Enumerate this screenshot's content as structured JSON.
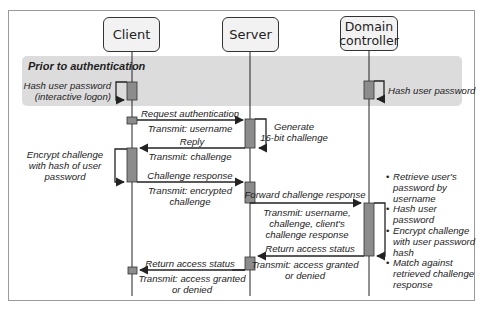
{
  "diagram": {
    "type": "sequence",
    "colors": {
      "band": "#dcdcdc",
      "activation": "#8c8c8c",
      "line": "#222222",
      "actor_fill": "#f2f2f2"
    }
  },
  "actors": [
    {
      "id": "client",
      "label": "Client"
    },
    {
      "id": "server",
      "label": "Server"
    },
    {
      "id": "dc",
      "label": "Domain controller",
      "line1": "Domain",
      "line2": "controller"
    }
  ],
  "band": {
    "title": "Prior to authentication",
    "client_note_line1": "Hash user password",
    "client_note_line2": "(interactive logon)",
    "dc_note": "Hash user password"
  },
  "messages": [
    {
      "from": "client",
      "to": "server",
      "label": "Request authentication",
      "sublabel": "Transmit: username"
    },
    {
      "from": "server",
      "to": "server",
      "label_line1": "Generate",
      "label_line2": "16-bit challenge"
    },
    {
      "from": "server",
      "to": "client",
      "label": "Reply",
      "sublabel": "Transmit: challenge"
    },
    {
      "from": "client",
      "to": "client",
      "label_line1": "Encrypt challenge",
      "label_line2": "with hash of user",
      "label_line3": "password"
    },
    {
      "from": "client",
      "to": "server",
      "label": "Challenge response",
      "sublabel_line1": "Transmit: encrypted",
      "sublabel_line2": "challenge"
    },
    {
      "from": "server",
      "to": "dc",
      "label": "Forward challenge response",
      "sublabel_line1": "Transmit: username,",
      "sublabel_line2": "challenge, client's",
      "sublabel_line3": "challenge response"
    },
    {
      "from": "dc",
      "to": "server",
      "label": "Return access status",
      "sublabel_line1": "Transmit: access granted",
      "sublabel_line2": "or denied"
    },
    {
      "from": "server",
      "to": "client",
      "label": "Return access status",
      "sublabel_line1": "Transmit: access granted",
      "sublabel_line2": "or denied"
    }
  ],
  "dc_notes": [
    {
      "line1": "Retrieve user's",
      "line2": "password by",
      "line3": "username"
    },
    {
      "line1": "Hash user password"
    },
    {
      "line1": "Encrypt challenge",
      "line2": "with user password",
      "line3": "hash"
    },
    {
      "line1": "Match against",
      "line2": "retrieved challenge",
      "line3": "response"
    }
  ]
}
